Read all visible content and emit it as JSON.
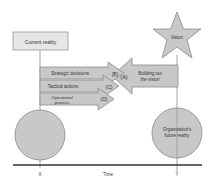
{
  "diagram": {
    "current_reality": "Current reality",
    "vision": "Vision",
    "future_reality_line1": "Organization's",
    "future_reality_line2": "future reality",
    "big_arrow": {
      "marker": "(A)",
      "line1": "Building out",
      "line2": "the vision"
    },
    "arrows": [
      {
        "label": "Strategic decisions",
        "marker": "(B)"
      },
      {
        "label": "Tactical actions",
        "marker": "(C)"
      },
      {
        "label_line1": "Operational",
        "label_line2": "process",
        "marker": "(D)"
      }
    ],
    "axis": {
      "label": "Time",
      "start": "X",
      "end": "Y"
    }
  },
  "colors": {
    "shape_fill": "#c8c8c8",
    "box_fill": "#e6e6e6",
    "stroke": "#8a8a8a",
    "axis": "#333333"
  }
}
